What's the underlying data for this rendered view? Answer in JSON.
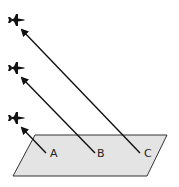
{
  "diagram": {
    "plane_surface": {
      "fill": "#e4e4e4",
      "stroke": "#333333"
    },
    "points": [
      {
        "label": "A"
      },
      {
        "label": "B"
      },
      {
        "label": "C"
      }
    ],
    "aircraft": [
      {
        "icon": "airplane-icon"
      },
      {
        "icon": "airplane-icon"
      },
      {
        "icon": "airplane-icon"
      }
    ]
  }
}
